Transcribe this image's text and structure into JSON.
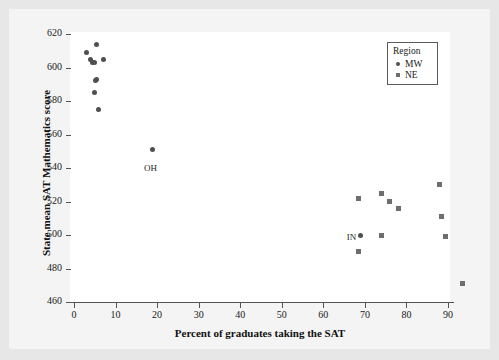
{
  "chart_data": {
    "type": "scatter",
    "title": "",
    "xlabel": "Percent of graduates taking the SAT",
    "ylabel": "State mean SAT Mathematics score",
    "xlim": [
      -3,
      97
    ],
    "ylim": [
      457,
      622
    ],
    "xticks": [
      0,
      10,
      20,
      30,
      40,
      50,
      60,
      70,
      80,
      90
    ],
    "yticks": [
      460,
      480,
      500,
      520,
      540,
      560,
      580,
      600,
      620
    ],
    "grid": false,
    "legend": {
      "title": "Region",
      "position": "top-right",
      "entries": [
        {
          "name": "MW",
          "marker": "circle",
          "color": "#4f4f4f"
        },
        {
          "name": "NE",
          "marker": "square",
          "color": "#6e6e6e"
        }
      ]
    },
    "series": [
      {
        "name": "MW",
        "marker": "circle",
        "color": "#4f4f4f",
        "points": [
          {
            "x": 3.0,
            "y": 609
          },
          {
            "x": 4.0,
            "y": 605
          },
          {
            "x": 4.5,
            "y": 603
          },
          {
            "x": 5.0,
            "y": 603
          },
          {
            "x": 5.3,
            "y": 614
          },
          {
            "x": 7.0,
            "y": 605
          },
          {
            "x": 5.5,
            "y": 593
          },
          {
            "x": 5.2,
            "y": 592
          },
          {
            "x": 5.0,
            "y": 585
          },
          {
            "x": 6.0,
            "y": 575
          },
          {
            "x": 19.0,
            "y": 551
          },
          {
            "x": 69.0,
            "y": 500
          }
        ]
      },
      {
        "name": "NE",
        "marker": "square",
        "color": "#6e6e6e",
        "points": [
          {
            "x": 68.5,
            "y": 522
          },
          {
            "x": 68.5,
            "y": 490
          },
          {
            "x": 74.0,
            "y": 525
          },
          {
            "x": 74.0,
            "y": 500
          },
          {
            "x": 76.0,
            "y": 520
          },
          {
            "x": 78.0,
            "y": 516
          },
          {
            "x": 88.0,
            "y": 530
          },
          {
            "x": 88.5,
            "y": 511
          },
          {
            "x": 89.5,
            "y": 499
          },
          {
            "x": 93.5,
            "y": 471
          }
        ]
      }
    ],
    "annotations": [
      {
        "text": "OH",
        "x": 19.0,
        "y": 551,
        "dx": -9,
        "dy": 13
      },
      {
        "text": "IN",
        "x": 69.0,
        "y": 500,
        "dx": -14,
        "dy": -3
      }
    ]
  }
}
